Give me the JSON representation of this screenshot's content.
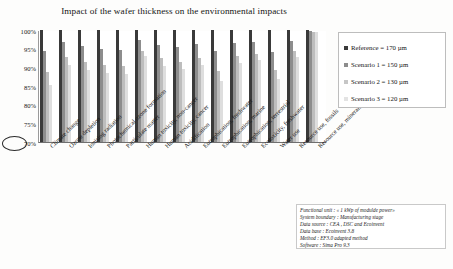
{
  "chart_data": {
    "type": "bar",
    "title": "Impact of the wafer thickness on the environmental impacts",
    "xlabel": "",
    "ylabel": "",
    "ylim": [
      70,
      100
    ],
    "grid": false,
    "legend_position": "right",
    "ytick_labels": [
      "100%",
      "95%",
      "90%",
      "85%",
      "80%",
      "75%",
      "70%"
    ],
    "ytick_values": [
      100,
      95,
      90,
      85,
      80,
      75,
      70
    ],
    "highlighted_ytick": "70%",
    "categories": [
      "Climate change",
      "Ozone depletion",
      "Ionising radiation",
      "Photochemical ozone formation",
      "Particulate matter",
      "Human toxicity, non-cancer",
      "Human toxicity, cancer",
      "Acidification",
      "Eutrophication, freshwater",
      "Eutrophication, marine",
      "Eutrophication, terrestrial",
      "Ecotoxicity, freshwater",
      "Water use",
      "Resource use, fossils",
      "Resource use, minerals and metals"
    ],
    "series": [
      {
        "name": "Reference = 170 µm",
        "color": "#3a3a3a",
        "values": [
          100,
          100,
          100,
          100,
          100,
          100,
          100,
          100,
          100,
          100,
          100,
          100,
          100,
          100,
          100
        ]
      },
      {
        "name": "Scenario 1 = 150 µm",
        "color": "#8d8d8d",
        "values": [
          94.5,
          96.8,
          95.6,
          94.8,
          94.7,
          97.3,
          96.0,
          95.5,
          96.3,
          94.3,
          96.5,
          96.8,
          94.2,
          97.0,
          99.8
        ]
      },
      {
        "name": "Scenario 2 = 130 µm",
        "color": "#c6c6c6",
        "values": [
          88.8,
          92.8,
          91.3,
          90.5,
          90.3,
          94.5,
          92.4,
          91.5,
          92.6,
          89.0,
          93.0,
          93.6,
          89.3,
          94.3,
          99.6
        ]
      },
      {
        "name": "Scenario 3 = 120 µm",
        "color": "#e3e3e3",
        "values": [
          85.3,
          90.7,
          89.3,
          88.6,
          88.2,
          93.1,
          90.4,
          89.5,
          90.7,
          86.3,
          91.2,
          91.9,
          86.8,
          92.8,
          99.4
        ]
      }
    ]
  },
  "legend": {
    "items": [
      {
        "label": "Reference = 170 µm"
      },
      {
        "label": "Scenario 1 = 150 µm"
      },
      {
        "label": "Scenario 2 = 130 µm"
      },
      {
        "label": "Scenario 3 = 120 µm"
      }
    ]
  },
  "footnote": {
    "lines": [
      "Functional unit : « 1 kWp of modulde power»",
      "System boundary : Manufacturing stage",
      "Data source : CEA , DSC and Ecoinvent",
      "Data base : Ecoinvent 3.8",
      "Method : EF3.0 adapted method",
      "Software : Sima Pro 9.3"
    ]
  }
}
